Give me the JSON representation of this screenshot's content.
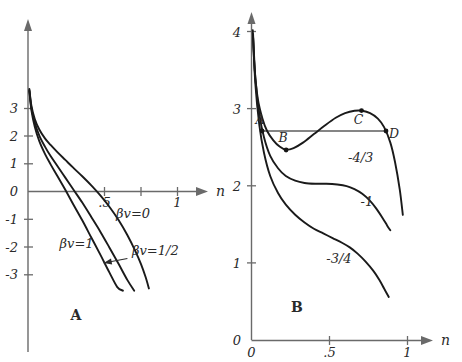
{
  "figure": {
    "width": 462,
    "height": 362,
    "background": "#ffffff",
    "ink": "#1a1a1a",
    "axis_color": "#6a6a6a"
  },
  "panels": [
    {
      "letter": "A",
      "axis_x_name": "n",
      "axis_y_name": "",
      "x_ticks": [
        ".5",
        "1"
      ],
      "y_ticks": [
        "3",
        "2",
        "1",
        "0",
        "-1",
        "-2",
        "-3"
      ],
      "curve_labels": [
        "βv=0",
        "βv=1",
        "βv=1/2"
      ]
    },
    {
      "letter": "B",
      "axis_x_name": "n",
      "axis_y_name": "",
      "x_ticks": [
        "0",
        ".5",
        "1"
      ],
      "y_ticks": [
        "4",
        "3",
        "2",
        "1",
        "0"
      ],
      "curve_labels": [
        "-4/3",
        "-1",
        "-3/4"
      ],
      "point_labels": [
        "A",
        "B",
        "C",
        "D"
      ]
    }
  ],
  "chart_data": [
    {
      "type": "line",
      "panel": "A",
      "title": "",
      "xlabel": "n",
      "ylabel": "",
      "xlim": [
        0,
        1.15
      ],
      "ylim": [
        -3.6,
        3.8
      ],
      "xticks": [
        0.5,
        1
      ],
      "xticklabels": [
        ".5",
        "1"
      ],
      "yticks": [
        3,
        2,
        1,
        0,
        -1,
        -2,
        -3
      ],
      "yticklabels": [
        "3",
        "2",
        "1",
        "0",
        "-1",
        "-2",
        "-3"
      ],
      "grid": false,
      "legend": "inline-curve-labels",
      "series": [
        {
          "name": "βv=0",
          "label": "βv=0",
          "label_xy": [
            0.78,
            -0.95
          ],
          "x": [
            0.012,
            0.03,
            0.06,
            0.1,
            0.15,
            0.2,
            0.26,
            0.33,
            0.4,
            0.48,
            0.56,
            0.64,
            0.72,
            0.8,
            0.88,
            0.95,
            1.0,
            1.04,
            1.07
          ],
          "y": [
            3.7,
            3.1,
            2.62,
            2.24,
            1.92,
            1.68,
            1.42,
            1.14,
            0.86,
            0.55,
            0.22,
            -0.14,
            -0.55,
            -1.02,
            -1.58,
            -2.15,
            -2.62,
            -3.08,
            -3.5
          ]
        },
        {
          "name": "βv=1/2",
          "label": "βv=1/2",
          "label_xy": [
            0.92,
            -2.3
          ],
          "arrow_from": [
            0.88,
            -2.42
          ],
          "arrow_to": [
            0.67,
            -2.58
          ],
          "x": [
            0.012,
            0.03,
            0.06,
            0.1,
            0.15,
            0.2,
            0.26,
            0.33,
            0.4,
            0.48,
            0.56,
            0.64,
            0.72,
            0.8,
            0.88,
            0.94
          ],
          "y": [
            3.66,
            3.02,
            2.48,
            2.02,
            1.62,
            1.28,
            0.92,
            0.5,
            0.08,
            -0.4,
            -0.92,
            -1.45,
            -2.02,
            -2.6,
            -3.2,
            -3.58
          ]
        },
        {
          "name": "βv=1",
          "label": "βv=1",
          "label_xy": [
            0.28,
            -2.05
          ],
          "x": [
            0.012,
            0.03,
            0.06,
            0.1,
            0.15,
            0.2,
            0.26,
            0.33,
            0.4,
            0.48,
            0.56,
            0.64,
            0.72,
            0.79,
            0.84
          ],
          "y": [
            3.62,
            2.94,
            2.34,
            1.82,
            1.36,
            0.98,
            0.56,
            0.06,
            -0.46,
            -1.04,
            -1.66,
            -2.28,
            -2.92,
            -3.45,
            -3.58
          ]
        }
      ]
    },
    {
      "type": "line",
      "panel": "B",
      "title": "",
      "xlabel": "n",
      "ylabel": "",
      "xlim": [
        0,
        1.14
      ],
      "ylim": [
        0,
        4.15
      ],
      "xticks": [
        0,
        0.5,
        1
      ],
      "xticklabels": [
        "0",
        ".5",
        "1"
      ],
      "yticks": [
        0,
        1,
        2,
        3,
        4
      ],
      "yticklabels": [
        "0",
        "1",
        "2",
        "3",
        "4"
      ],
      "grid": false,
      "legend": "inline-curve-labels",
      "series": [
        {
          "name": "-4/3",
          "label": "-4/3",
          "label_xy": [
            0.7,
            2.3
          ],
          "x": [
            0.008,
            0.02,
            0.04,
            0.07,
            0.1,
            0.14,
            0.18,
            0.22,
            0.27,
            0.33,
            0.4,
            0.47,
            0.54,
            0.6,
            0.66,
            0.71,
            0.76,
            0.81,
            0.85,
            0.89,
            0.92,
            0.95,
            0.97
          ],
          "y": [
            4.0,
            3.5,
            3.12,
            2.86,
            2.7,
            2.58,
            2.5,
            2.46,
            2.48,
            2.55,
            2.66,
            2.77,
            2.87,
            2.93,
            2.96,
            2.96,
            2.93,
            2.86,
            2.75,
            2.55,
            2.3,
            1.95,
            1.62
          ]
        },
        {
          "name": "-1",
          "label": "-1",
          "label_xy": [
            0.74,
            1.73
          ],
          "x": [
            0.01,
            0.025,
            0.05,
            0.08,
            0.12,
            0.17,
            0.22,
            0.28,
            0.34,
            0.41,
            0.48,
            0.55,
            0.61,
            0.66,
            0.71,
            0.76,
            0.8,
            0.84,
            0.87,
            0.89
          ],
          "y": [
            3.95,
            3.38,
            2.92,
            2.62,
            2.38,
            2.22,
            2.12,
            2.06,
            2.03,
            2.02,
            2.02,
            2.01,
            1.99,
            1.95,
            1.89,
            1.8,
            1.7,
            1.58,
            1.48,
            1.42
          ]
        },
        {
          "name": "-3/4",
          "label": "-3/4",
          "label_xy": [
            0.56,
            1.0
          ],
          "x": [
            0.01,
            0.025,
            0.05,
            0.08,
            0.12,
            0.17,
            0.22,
            0.28,
            0.34,
            0.4,
            0.46,
            0.52,
            0.58,
            0.63,
            0.68,
            0.73,
            0.78,
            0.82,
            0.85,
            0.88
          ],
          "y": [
            3.92,
            3.3,
            2.78,
            2.42,
            2.12,
            1.9,
            1.75,
            1.62,
            1.52,
            1.44,
            1.38,
            1.32,
            1.26,
            1.2,
            1.12,
            1.02,
            0.9,
            0.78,
            0.67,
            0.56
          ]
        }
      ],
      "annotations": {
        "tie_line": {
          "y": 2.7,
          "x_start": 0.068,
          "x_end": 0.862
        },
        "points": [
          {
            "label": "A",
            "x": 0.068,
            "y": 2.7,
            "label_dx": -2,
            "label_dy": -7
          },
          {
            "label": "B",
            "x": 0.222,
            "y": 2.455,
            "label_dx": -3,
            "label_dy": -8
          },
          {
            "label": "C",
            "x": 0.705,
            "y": 2.962,
            "label_dx": -3,
            "label_dy": 13
          },
          {
            "label": "D",
            "x": 0.862,
            "y": 2.7,
            "label_dx": 8,
            "label_dy": 7
          }
        ]
      }
    }
  ]
}
